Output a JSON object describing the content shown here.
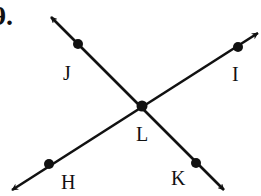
{
  "problem": {
    "number_label": "9."
  },
  "diagram": {
    "intersection": {
      "label": "L",
      "x": 142,
      "y": 106
    },
    "lines": [
      {
        "name": "line-JK",
        "from": [
          51,
          17
        ],
        "to": [
          224,
          190
        ],
        "points": [
          "J",
          "L",
          "K"
        ]
      },
      {
        "name": "line-HI",
        "from": [
          12,
          190
        ],
        "to": [
          261,
          32
        ],
        "points": [
          "H",
          "L",
          "I"
        ]
      }
    ],
    "points": [
      {
        "label": "J",
        "x": 78,
        "y": 44,
        "label_x": 63,
        "label_y": 63
      },
      {
        "label": "I",
        "x": 238,
        "y": 47,
        "label_x": 233,
        "label_y": 65
      },
      {
        "label": "L",
        "x": 142,
        "y": 106,
        "label_x": 137,
        "label_y": 126
      },
      {
        "label": "H",
        "x": 49,
        "y": 164,
        "label_x": 61,
        "label_y": 174
      },
      {
        "label": "K",
        "x": 196,
        "y": 163,
        "label_x": 171,
        "label_y": 169
      }
    ],
    "colors": {
      "line": "#111111",
      "background": "#ffffff"
    }
  }
}
